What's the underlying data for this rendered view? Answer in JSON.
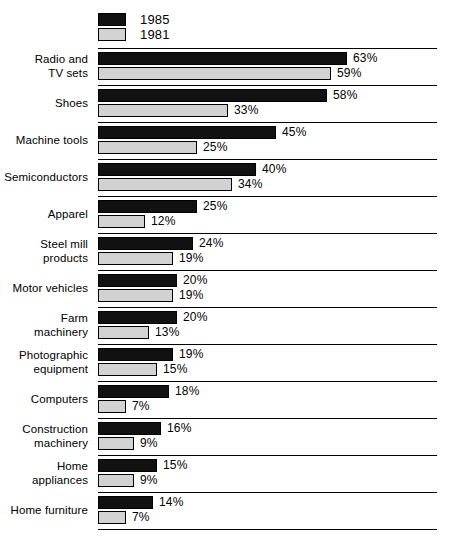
{
  "legend": {
    "items": [
      {
        "label": "1985",
        "color": "#111111",
        "swatch": "legend-swatch-1985"
      },
      {
        "label": "1981",
        "color": "#d2d2d2",
        "swatch": "legend-swatch-1981"
      }
    ]
  },
  "chart_data": {
    "type": "bar",
    "orientation": "horizontal",
    "title": "",
    "subtitle": "",
    "xlabel": "",
    "ylabel": "",
    "xlim": [
      0,
      63
    ],
    "grid": false,
    "legend_position": "top-left",
    "value_suffix": "%",
    "categories": [
      "Radio and\nTV sets",
      "Shoes",
      "Machine tools",
      "Semiconductors",
      "Apparel",
      "Steel mill\nproducts",
      "Motor vehicles",
      "Farm\nmachinery",
      "Photographic\nequipment",
      "Computers",
      "Construction\nmachinery",
      "Home\nappliances",
      "Home furniture"
    ],
    "series": [
      {
        "name": "1985",
        "color": "#111111",
        "values": [
          63,
          58,
          45,
          40,
          25,
          24,
          20,
          20,
          19,
          18,
          16,
          15,
          14
        ],
        "labels": [
          "63%",
          "58%",
          "45%",
          "40%",
          "25%",
          "24%",
          "20%",
          "20%",
          "19%",
          "18%",
          "16%",
          "15%",
          "14%"
        ]
      },
      {
        "name": "1981",
        "color": "#d2d2d2",
        "values": [
          59,
          33,
          25,
          34,
          12,
          19,
          19,
          13,
          15,
          7,
          9,
          9,
          7
        ],
        "labels": [
          "59%",
          "33%",
          "25%",
          "34%",
          "12%",
          "19%",
          "19%",
          "13%",
          "15%",
          "7%",
          "9%",
          "9%",
          "7%"
        ]
      }
    ]
  }
}
